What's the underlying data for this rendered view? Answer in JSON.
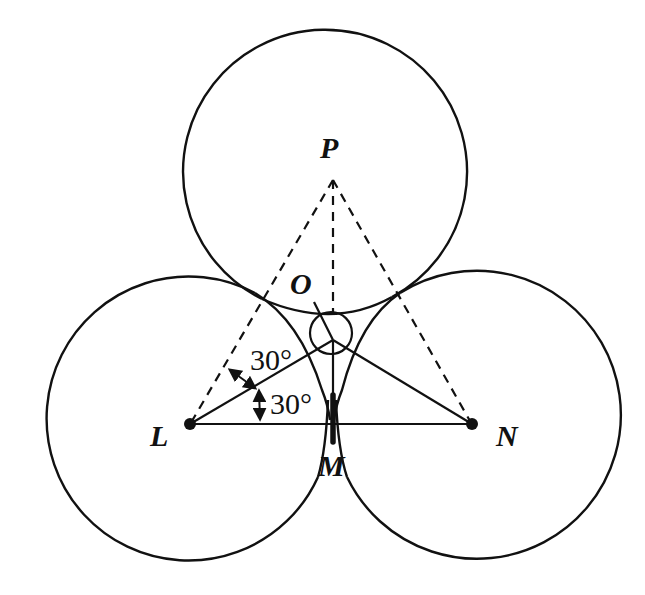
{
  "diagram": {
    "type": "geometry",
    "circles": [
      {
        "id": "P",
        "cx": 326,
        "cy": 172,
        "r": 142
      },
      {
        "id": "L",
        "cx": 190,
        "cy": 420,
        "r": 142
      },
      {
        "id": "N",
        "cx": 472,
        "cy": 420,
        "r": 144
      },
      {
        "id": "O",
        "cx": 331,
        "cy": 333,
        "r": 21
      }
    ],
    "points": {
      "P": {
        "x": 333,
        "y": 178
      },
      "L": {
        "x": 190,
        "y": 424
      },
      "N": {
        "x": 472,
        "y": 424
      },
      "M": {
        "x": 332,
        "y": 424
      },
      "O": {
        "x": 332,
        "y": 340
      }
    },
    "labels": {
      "P": "P",
      "O": "O",
      "L": "L",
      "M": "M",
      "N": "N",
      "angle_upper": "30°",
      "angle_lower": "30°"
    },
    "angles": [
      {
        "vertex": "L",
        "value": "30°",
        "between": [
          "LP",
          "LO"
        ]
      },
      {
        "vertex": "L",
        "value": "30°",
        "between": [
          "LO",
          "LM"
        ]
      }
    ],
    "colors": {
      "stroke": "#111111",
      "background": "#ffffff"
    }
  }
}
